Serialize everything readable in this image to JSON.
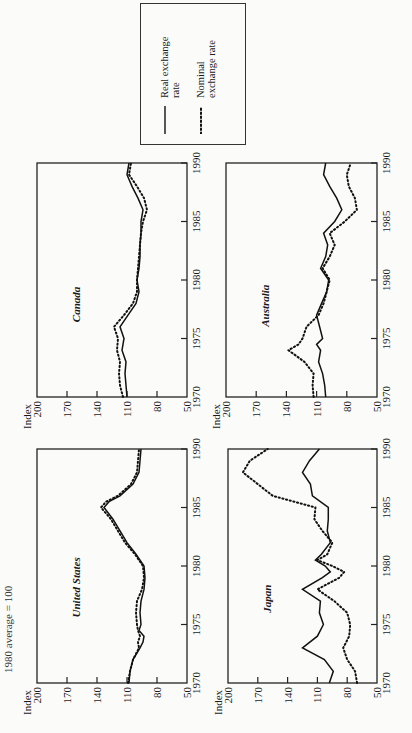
{
  "figure": {
    "caption_fragment": "1980 average = 100",
    "y_axis_label": "Index",
    "y_ticks": [
      200,
      170,
      140,
      110,
      80,
      50
    ],
    "x_ticks": [
      1970,
      1975,
      1980,
      1985,
      1990
    ]
  },
  "legend": {
    "real_label": "Real exchange rate",
    "nominal_label": "Nominal exchange rate",
    "real_style": "solid",
    "nominal_style": "dotted"
  },
  "panels": {
    "us": {
      "title": "United States"
    },
    "japan": {
      "title": "Japan"
    },
    "canada": {
      "title": "Canada"
    },
    "australia": {
      "title": "Australia"
    }
  },
  "chart_data": [
    {
      "type": "line",
      "title": "United States",
      "xlabel": "",
      "ylabel": "Index",
      "ylim": [
        50,
        200
      ],
      "xlim": [
        1970,
        1990
      ],
      "x": [
        1970,
        1971,
        1972,
        1973,
        1973.5,
        1974,
        1974.5,
        1975,
        1976,
        1977,
        1978,
        1979,
        1980,
        1981,
        1982,
        1983,
        1984,
        1985,
        1985.5,
        1986,
        1987,
        1988,
        1989,
        1990
      ],
      "series": [
        {
          "name": "Real exchange rate",
          "values": [
            108,
            107,
            104,
            97,
            94,
            93,
            98,
            96,
            97,
            96,
            93,
            92,
            93,
            101,
            110,
            117,
            124,
            133,
            128,
            117,
            104,
            98,
            97,
            96
          ]
        },
        {
          "name": "Nominal exchange rate",
          "values": [
            109,
            107,
            104,
            98,
            99,
            97,
            99,
            100,
            101,
            100,
            95,
            93,
            94,
            102,
            112,
            119,
            126,
            136,
            131,
            119,
            106,
            100,
            99,
            98
          ]
        }
      ]
    },
    {
      "type": "line",
      "title": "Japan",
      "xlabel": "",
      "ylabel": "Index",
      "ylim": [
        50,
        200
      ],
      "xlim": [
        1970,
        1990
      ],
      "x": [
        1970,
        1971,
        1972,
        1973,
        1974,
        1975,
        1976,
        1977,
        1978,
        1979,
        1979.5,
        1980,
        1980.5,
        1981,
        1982,
        1983,
        1984,
        1985,
        1986,
        1987,
        1988,
        1989,
        1990
      ],
      "series": [
        {
          "name": "Real exchange rate",
          "values": [
            98,
            94,
            103,
            125,
            110,
            104,
            108,
            107,
            125,
            105,
            97,
            102,
            112,
            106,
            97,
            100,
            99,
            99,
            115,
            117,
            125,
            118,
            108
          ]
        },
        {
          "name": "Nominal exchange rate",
          "values": [
            70,
            72,
            80,
            84,
            78,
            77,
            80,
            93,
            110,
            88,
            83,
            95,
            110,
            100,
            95,
            105,
            113,
            112,
            155,
            170,
            185,
            178,
            160
          ]
        }
      ]
    },
    {
      "type": "line",
      "title": "Canada",
      "xlabel": "",
      "ylabel": "Index",
      "ylim": [
        50,
        200
      ],
      "xlim": [
        1970,
        1990
      ],
      "x": [
        1970,
        1971,
        1972,
        1973,
        1974,
        1975,
        1976,
        1977,
        1978,
        1979,
        1980,
        1981,
        1982,
        1983,
        1984,
        1985,
        1986,
        1987,
        1988,
        1989,
        1990
      ],
      "series": [
        {
          "name": "Real exchange rate",
          "values": [
            110,
            111,
            112,
            111,
            115,
            113,
            117,
            109,
            101,
            98,
            100,
            98,
            97,
            97,
            96,
            96,
            94,
            99,
            105,
            110,
            108
          ]
        },
        {
          "name": "Nominal exchange rate",
          "values": [
            114,
            117,
            118,
            117,
            120,
            119,
            123,
            113,
            104,
            100,
            100,
            99,
            98,
            97,
            96,
            94,
            90,
            93,
            100,
            108,
            106
          ]
        }
      ]
    },
    {
      "type": "line",
      "title": "Australia",
      "xlabel": "",
      "ylabel": "Index",
      "ylim": [
        50,
        200
      ],
      "xlim": [
        1970,
        1990
      ],
      "x": [
        1970,
        1971,
        1972,
        1973,
        1974,
        1974.5,
        1975,
        1976,
        1977,
        1978,
        1979,
        1980,
        1981,
        1982,
        1983,
        1984,
        1985,
        1986,
        1987,
        1988,
        1989,
        1990
      ],
      "series": [
        {
          "name": "Real exchange rate",
          "values": [
            101,
            102,
            104,
            108,
            106,
            110,
            104,
            107,
            110,
            105,
            100,
            98,
            106,
            101,
            99,
            103,
            92,
            85,
            90,
            97,
            103,
            101
          ]
        },
        {
          "name": "Nominal exchange rate",
          "values": [
            113,
            114,
            113,
            122,
            138,
            128,
            124,
            120,
            108,
            103,
            100,
            97,
            104,
            97,
            92,
            97,
            82,
            70,
            72,
            78,
            80,
            76
          ]
        }
      ]
    }
  ]
}
